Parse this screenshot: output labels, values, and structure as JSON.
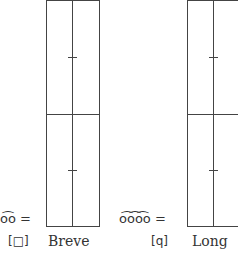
{
  "figures": [
    {
      "name": "Breve",
      "notes_equivalent": "◌̂◌ =",
      "notes_symbol": "o͡o =",
      "glyph": "[□]",
      "label": "Breve"
    },
    {
      "name": "Long",
      "notes_symbol": "o͡o͡o͡o =",
      "glyph": "[ꟼ]",
      "glyph_display": "[q]",
      "label": "Long"
    }
  ],
  "colors": {
    "line": "#444444",
    "text": "#333333",
    "background": "#ffffff"
  }
}
